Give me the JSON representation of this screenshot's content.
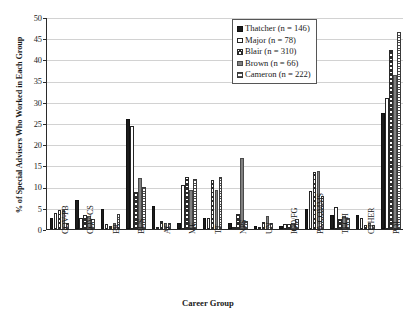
{
  "chart_data": {
    "type": "bar",
    "title": "",
    "xlabel": "Career Group",
    "ylabel": "% of Special Advisers Who Worked in Each Group",
    "ylim": [
      0,
      50
    ],
    "ytick_step": 5,
    "yticks": [
      0,
      5,
      10,
      15,
      20,
      25,
      30,
      35,
      40,
      45,
      50
    ],
    "grid": true,
    "legend_position": "top-right",
    "categories": [
      "GOV-PB",
      "GOV-CS",
      "ER",
      "BUS",
      "AC",
      "ME",
      "TT",
      "NPS",
      "UN",
      "IGO/FG",
      "PA/COMMS",
      "TECH",
      "OTHER",
      "POL"
    ],
    "series": [
      {
        "name": "Thatcher",
        "n": 146,
        "label": "Thatcher (n = 146)",
        "fill": "solid-black",
        "color": "#1c1c1c",
        "values": [
          2.7,
          6.8,
          4.8,
          26.0,
          5.5,
          1.4,
          2.7,
          1.4,
          0.7,
          0.7,
          4.8,
          3.4,
          3.4,
          27.4
        ]
      },
      {
        "name": "Major",
        "n": 78,
        "label": "Major (n = 78)",
        "fill": "white",
        "color": "#ffffff",
        "values": [
          3.8,
          2.6,
          1.3,
          24.4,
          0.0,
          10.3,
          2.6,
          0.0,
          0.0,
          1.3,
          9.0,
          5.1,
          2.6,
          30.8
        ]
      },
      {
        "name": "Blair",
        "n": 310,
        "label": "Blair (n = 310)",
        "fill": "cross-hatch",
        "color": "#2b2b2b",
        "values": [
          4.5,
          3.2,
          0.6,
          8.7,
          1.9,
          12.3,
          11.6,
          3.5,
          1.6,
          1.3,
          13.5,
          2.3,
          1.0,
          42.3
        ]
      },
      {
        "name": "Brown",
        "n": 66,
        "label": "Brown (n = 66)",
        "fill": "grey",
        "color": "#808080",
        "values": [
          4.5,
          3.0,
          1.5,
          12.1,
          1.5,
          9.1,
          9.1,
          16.7,
          3.0,
          1.5,
          13.6,
          3.0,
          1.5,
          36.4
        ]
      },
      {
        "name": "Cameron",
        "n": 222,
        "label": "Cameron (n = 222)",
        "fill": "horizontal-lines",
        "color": "#4d4d4d",
        "values": [
          1.4,
          2.3,
          3.6,
          9.9,
          1.4,
          11.7,
          12.2,
          1.8,
          1.4,
          2.3,
          7.7,
          2.7,
          0.9,
          46.4
        ]
      }
    ]
  },
  "axis": {
    "ylabel": "% of Special Advisers Who Worked in Each Group",
    "xlabel": "Career Group"
  },
  "caption": {
    "text": ""
  }
}
